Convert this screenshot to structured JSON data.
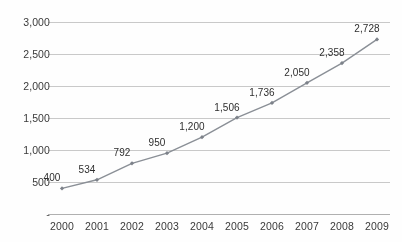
{
  "chart_data": {
    "type": "line",
    "title": "",
    "subtitle": "",
    "xlabel": "",
    "ylabel": "",
    "categories": [
      "2000",
      "2001",
      "2002",
      "2003",
      "2004",
      "2005",
      "2006",
      "2007",
      "2008",
      "2009"
    ],
    "values": [
      400,
      534,
      792,
      950,
      1200,
      1506,
      1736,
      2050,
      2358,
      2728
    ],
    "point_labels": [
      "400",
      "534",
      "792",
      "950",
      "1,200",
      "1,506",
      "1,736",
      "2,050",
      "2,358",
      "2,728"
    ],
    "series": [
      {
        "name": "",
        "values": [
          400,
          534,
          792,
          950,
          1200,
          1506,
          1736,
          2050,
          2358,
          2728
        ]
      }
    ],
    "ylim": [
      0,
      3000
    ],
    "ytick_values": [
      0,
      500,
      1000,
      1500,
      2000,
      2500,
      3000
    ],
    "ytick_labels": [
      "-",
      "500",
      "1,000",
      "1,500",
      "2,000",
      "2,500",
      "3,000"
    ],
    "xtick_labels": [
      "2000",
      "2001",
      "2002",
      "2003",
      "2004",
      "2005",
      "2006",
      "2007",
      "2008",
      "2009"
    ],
    "grid": "horizontal",
    "legend": "none",
    "marker": "diamond",
    "colors": {
      "line": "#8a8f96",
      "marker": "#7d828a",
      "gridline": "#c9c9c9",
      "axis": "#b0b0b0",
      "label_text": "#2e2e2e",
      "tick_text": "#3a3a3a",
      "background": "#ffffff"
    }
  }
}
